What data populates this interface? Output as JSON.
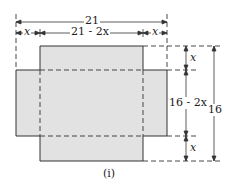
{
  "figure": {
    "caption": "(i)",
    "colors": {
      "fill": "#e2e2e2",
      "stroke": "#333333",
      "background": "#ffffff"
    },
    "dimensions": {
      "total_width": "21",
      "left_flap": "x",
      "inner_width": "21 - 2x",
      "right_flap": "x",
      "top_flap": "x",
      "inner_height": "16 - 2x",
      "bottom_flap": "x",
      "total_height": "16"
    }
  }
}
